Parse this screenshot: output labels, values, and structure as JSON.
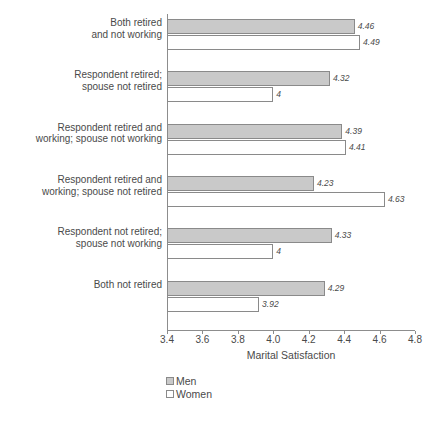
{
  "chart_data": {
    "type": "bar",
    "orientation": "horizontal",
    "title": "",
    "xlabel": "Marital Satisfaction",
    "ylabel": "",
    "xlim": [
      3.4,
      4.8
    ],
    "xticks": [
      "3.4",
      "3.6",
      "3.8",
      "4.0",
      "4.2",
      "4.4",
      "4.6",
      "4.8"
    ],
    "xtick_values": [
      3.4,
      3.6,
      3.8,
      4.0,
      4.2,
      4.4,
      4.6,
      4.8
    ],
    "grid": false,
    "legend_position": "bottom-left",
    "categories": [
      "Both retired\nand not working",
      "Respondent retired;\nspouse not retired",
      "Respondent retired and\nworking; spouse not working",
      "Respondent retired and\nworking; spouse not retired",
      "Respondent not retired;\nspouse not working",
      "Both not retired"
    ],
    "series": [
      {
        "name": "Men",
        "color": "#c9c9c9",
        "values": [
          4.46,
          4.32,
          4.39,
          4.23,
          4.33,
          4.29
        ],
        "labels": [
          "4.46",
          "4.32",
          "4.39",
          "4.23",
          "4.33",
          "4.29"
        ]
      },
      {
        "name": "Women",
        "color": "#ffffff",
        "values": [
          4.49,
          4.0,
          4.41,
          4.63,
          4.0,
          3.92
        ],
        "labels": [
          "4.49",
          "4",
          "4.41",
          "4.63",
          "4",
          "3.92"
        ]
      }
    ]
  },
  "legend": {
    "items": [
      {
        "label": "Men"
      },
      {
        "label": "Women"
      }
    ]
  }
}
